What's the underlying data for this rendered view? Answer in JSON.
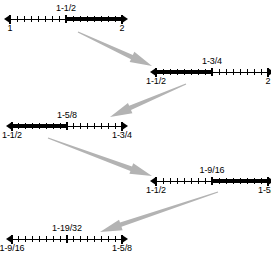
{
  "figure": {
    "background_color": "#ffffff",
    "line_color": "#000000",
    "bold_color": "#000000",
    "tick_color": "#000000",
    "arrow_fill": "#b3b3b3",
    "label_font_size_px": 9
  },
  "number_lines": [
    {
      "id": "line-1",
      "left_label": "1",
      "right_label": "2",
      "mid_label": "1-1/2",
      "highlight": "right",
      "ticks": 16,
      "geom": {
        "x1": 10,
        "x2": 122,
        "y": 19,
        "mid_label_y": 3,
        "end_label_y": 23
      }
    },
    {
      "id": "line-2",
      "left_label": "1-1/2",
      "right_label": "2",
      "mid_label": "1-3/4",
      "highlight": "left",
      "ticks": 16,
      "geom": {
        "x1": 156,
        "x2": 268,
        "y": 72,
        "mid_label_y": 56,
        "end_label_y": 76
      }
    },
    {
      "id": "line-3",
      "left_label": "1-1/2",
      "right_label": "1-3/4",
      "mid_label": "1-5/8",
      "highlight": "left",
      "ticks": 16,
      "geom": {
        "x1": 12,
        "x2": 122,
        "y": 126,
        "mid_label_y": 110,
        "end_label_y": 130
      }
    },
    {
      "id": "line-4",
      "left_label": "1-1/2",
      "right_label": "1-5/8",
      "mid_label": "1-9/16",
      "highlight": "right",
      "ticks": 16,
      "geom": {
        "x1": 156,
        "x2": 268,
        "y": 181,
        "mid_label_y": 165,
        "end_label_y": 185
      }
    },
    {
      "id": "line-5",
      "left_label": "1-9/16",
      "right_label": "1-5/8",
      "mid_label": "1-19/32",
      "highlight": "none",
      "ticks": 16,
      "geom": {
        "x1": 12,
        "x2": 122,
        "y": 239,
        "mid_label_y": 223,
        "end_label_y": 243
      }
    }
  ],
  "arrows": [
    {
      "id": "arrow-1",
      "direction": "down-right",
      "from": [
        78,
        32
      ],
      "to": [
        152,
        66
      ]
    },
    {
      "id": "arrow-2",
      "direction": "down-left",
      "from": [
        186,
        84
      ],
      "to": [
        110,
        117
      ]
    },
    {
      "id": "arrow-3",
      "direction": "down-right",
      "from": [
        48,
        138
      ],
      "to": [
        152,
        176
      ]
    },
    {
      "id": "arrow-4",
      "direction": "down-left",
      "from": [
        218,
        192
      ],
      "to": [
        100,
        232
      ]
    }
  ],
  "chart_data": {
    "type": "line",
    "xlabel": "",
    "ylabel": "",
    "steps": [
      {
        "step": 1,
        "interval": [
          "1",
          "2"
        ],
        "midpoint": "1-1/2",
        "selected_half": "right"
      },
      {
        "step": 2,
        "interval": [
          "1-1/2",
          "2"
        ],
        "midpoint": "1-3/4",
        "selected_half": "left"
      },
      {
        "step": 3,
        "interval": [
          "1-1/2",
          "1-3/4"
        ],
        "midpoint": "1-5/8",
        "selected_half": "left"
      },
      {
        "step": 4,
        "interval": [
          "1-1/2",
          "1-5/8"
        ],
        "midpoint": "1-9/16",
        "selected_half": "right"
      },
      {
        "step": 5,
        "interval": [
          "1-9/16",
          "1-5/8"
        ],
        "midpoint": "1-19/32",
        "selected_half": "none"
      }
    ]
  }
}
